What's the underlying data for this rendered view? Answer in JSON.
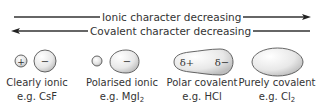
{
  "arrows": {
    "ionic": {
      "label": "Ionic character decreasing",
      "direction": "right"
    },
    "covalent": {
      "label": "Covalent character decreasing",
      "direction": "left"
    }
  },
  "species": [
    {
      "name": "Clearly ionic",
      "example_prefix": "e.g. ",
      "formula": "CsF",
      "subscript": "",
      "charges": [
        "+",
        "−"
      ]
    },
    {
      "name": "Polarised ionic",
      "example_prefix": "e.g. ",
      "formula": "MgI",
      "subscript": "2",
      "charges": [
        "",
        "−"
      ]
    },
    {
      "name": "Polar covalent",
      "example_prefix": "e.g. ",
      "formula": "HCl",
      "subscript": "",
      "charges": [
        "δ+",
        "δ−"
      ]
    },
    {
      "name": "Purely covalent",
      "example_prefix": "e.g. ",
      "formula": "Cl",
      "subscript": "2",
      "charges": []
    }
  ],
  "colors": {
    "line": "#333333",
    "shape_fill_light": "#f2f2f2",
    "shape_fill_dark": "#c8c8c8",
    "shape_stroke": "#555555",
    "text": "#333333"
  }
}
